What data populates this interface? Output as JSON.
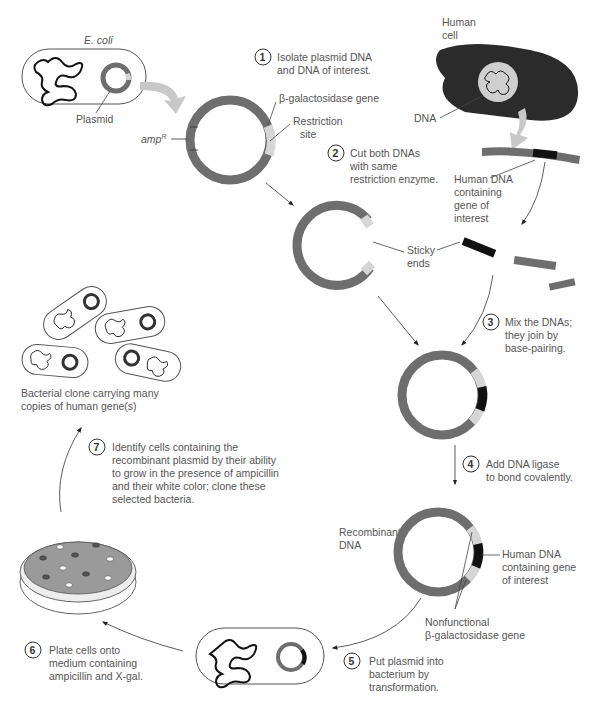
{
  "colors": {
    "plasmid": "#6e6e6e",
    "beta_gal": "#d6d6d6",
    "human_dna": "#111111",
    "human_cell": "#2b2b2b",
    "nucleus": "#cfcfcf",
    "arrow_fill": "#c8c8c8",
    "text": "#555555",
    "plate_medium": "#9a9a9a"
  },
  "labels": {
    "ecoli": "E. coli",
    "plasmid": "Plasmid",
    "ampR": "amp",
    "ampR_sup": "R",
    "beta_gal_gene": "β-galactosidase gene",
    "restriction_site_1": "Restriction",
    "restriction_site_2": "site",
    "human_cell_1": "Human",
    "human_cell_2": "cell",
    "dna": "DNA",
    "human_dna_1": "Human DNA",
    "human_dna_2": "containing",
    "human_dna_3": "gene of",
    "human_dna_4": "interest",
    "sticky_1": "Sticky",
    "sticky_2": "ends",
    "recombinant_1": "Recombinant",
    "recombinant_2": "DNA",
    "human_dna_gene_1": "Human DNA",
    "human_dna_gene_2": "containing gene",
    "human_dna_gene_3": "of interest",
    "nonfunctional_1": "Nonfunctional",
    "nonfunctional_2": "β-galactosidase gene",
    "clone_1": "Bacterial clone carrying many",
    "clone_2": "copies of human gene(s)"
  },
  "steps": [
    {
      "num": "1",
      "lines": [
        "Isolate plasmid DNA",
        "and DNA of interest."
      ]
    },
    {
      "num": "2",
      "lines": [
        "Cut both DNAs",
        "with same",
        "restriction enzyme."
      ]
    },
    {
      "num": "3",
      "lines": [
        "Mix the DNAs;",
        "they join by",
        "base-pairing."
      ]
    },
    {
      "num": "4",
      "lines": [
        "Add DNA ligase",
        "to bond covalently."
      ]
    },
    {
      "num": "5",
      "lines": [
        "Put plasmid into",
        "bacterium by",
        "transformation."
      ]
    },
    {
      "num": "6",
      "lines": [
        "Plate cells onto",
        "medium containing",
        "ampicillin and X-gal."
      ]
    },
    {
      "num": "7",
      "lines": [
        "Identify cells containing the",
        "recombinant plasmid by their ability",
        "to grow in the presence of ampicillin",
        "and their white color; clone these",
        "selected bacteria."
      ]
    }
  ]
}
